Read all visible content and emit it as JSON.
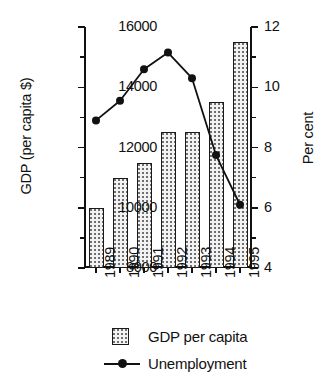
{
  "chart_data": {
    "type": "bar",
    "title": "",
    "subtitle": "",
    "xlabel": "",
    "ylabel": "GDP (per capita $)",
    "y2label": "Per cent",
    "categories": [
      "1989",
      "1990",
      "1991",
      "1992",
      "1993",
      "1994",
      "1995"
    ],
    "grid": false,
    "legend_position": "bottom",
    "ylim": [
      8000,
      16000
    ],
    "y_ticks": [
      8000,
      10000,
      12000,
      14000,
      16000
    ],
    "y_minor_ticks": [
      9000,
      11000,
      13000,
      15000
    ],
    "y2lim": [
      4,
      12
    ],
    "y2_ticks": [
      4,
      6,
      8,
      10,
      12
    ],
    "y2_minor_ticks": [
      5,
      7,
      9,
      11
    ],
    "series": [
      {
        "name": "GDP per capita",
        "type": "bar",
        "axis": "left",
        "values": [
          10000,
          11000,
          11500,
          12500,
          12500,
          13500,
          15500
        ]
      },
      {
        "name": "Unemployment",
        "type": "line",
        "axis": "right",
        "values": [
          8.9,
          9.55,
          10.6,
          11.15,
          10.3,
          7.75,
          6.1
        ]
      }
    ]
  },
  "legend": {
    "items": [
      {
        "label": "GDP per capita",
        "key": "patterned-square"
      },
      {
        "label": "Unemployment",
        "key": "line-with-marker"
      }
    ]
  },
  "colors": {
    "axis": "#111111",
    "bar_fill": "#f2f2f2",
    "bar_pattern": "#6f6f6f",
    "bar_edge": "#1a1a1a",
    "line": "#111111",
    "marker": "#111111",
    "background": "#ffffff"
  }
}
